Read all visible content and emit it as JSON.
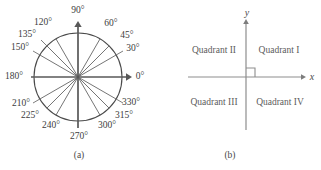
{
  "figure": {
    "panels": [
      {
        "id": "a",
        "caption": "(a)",
        "type": "polar-angle-diagram",
        "description": "Unit circle with rays drawn at standard angles, labeled in degrees",
        "circle": {
          "center_x": 78,
          "center_y": 77,
          "radius": 44
        },
        "axes": {
          "horizontal": {
            "x1": 31,
            "x2": 128,
            "y": 77,
            "arrow": "right"
          },
          "vertical": {
            "y1": 25,
            "y2": 128,
            "x": 78,
            "arrow": "up"
          }
        },
        "angle_labels": [
          {
            "text": "90°",
            "deg": 90,
            "x": 78,
            "y": 11,
            "align": "center"
          },
          {
            "text": "120°",
            "deg": 120,
            "x": 43,
            "y": 23,
            "align": "center"
          },
          {
            "text": "135°",
            "deg": 135,
            "x": 27,
            "y": 35,
            "align": "center"
          },
          {
            "text": "150°",
            "deg": 150,
            "x": 20,
            "y": 48,
            "align": "center"
          },
          {
            "text": "180°",
            "deg": 180,
            "x": 14,
            "y": 77,
            "align": "center"
          },
          {
            "text": "210°",
            "deg": 210,
            "x": 21,
            "y": 104,
            "align": "center"
          },
          {
            "text": "225°",
            "deg": 225,
            "x": 30,
            "y": 116,
            "align": "center"
          },
          {
            "text": "240°",
            "deg": 240,
            "x": 51,
            "y": 126,
            "align": "center"
          },
          {
            "text": "270°",
            "deg": 270,
            "x": 79,
            "y": 137,
            "align": "center"
          },
          {
            "text": "300°",
            "deg": 300,
            "x": 107,
            "y": 126,
            "align": "center"
          },
          {
            "text": "315°",
            "deg": 315,
            "x": 124,
            "y": 116,
            "align": "center"
          },
          {
            "text": "330°",
            "deg": 330,
            "x": 131,
            "y": 103,
            "align": "center"
          },
          {
            "text": "0°",
            "deg": 0,
            "x": 140,
            "y": 77,
            "align": "center"
          },
          {
            "text": "30°",
            "deg": 30,
            "x": 133,
            "y": 49,
            "align": "center"
          },
          {
            "text": "45°",
            "deg": 45,
            "x": 127,
            "y": 36,
            "align": "center"
          },
          {
            "text": "60°",
            "deg": 60,
            "x": 111,
            "y": 24,
            "align": "center"
          }
        ],
        "ray_angles_deg": [
          30,
          45,
          60,
          120,
          135,
          150,
          210,
          225,
          240,
          300,
          315,
          330
        ],
        "leader_lines": [
          {
            "deg": 150,
            "from_r": 44,
            "to_r": 52
          },
          {
            "deg": 135,
            "from_r": 44,
            "to_r": 52
          },
          {
            "deg": 30,
            "from_r": 44,
            "to_r": 52
          },
          {
            "deg": 210,
            "from_r": 44,
            "to_r": 52
          },
          {
            "deg": 330,
            "from_r": 44,
            "to_r": 52
          }
        ]
      },
      {
        "id": "b",
        "caption": "(b)",
        "type": "quadrant-diagram",
        "description": "Cartesian axes dividing the plane into four labeled quadrants",
        "origin": {
          "x": 86,
          "y": 77
        },
        "axes": {
          "horizontal": {
            "x1": 28,
            "x2": 143,
            "y": 77,
            "arrow": "right",
            "label": "x"
          },
          "vertical": {
            "y1": 22,
            "y2": 130,
            "x": 86,
            "arrow": "up",
            "label": "y"
          }
        },
        "axis_labels": [
          {
            "name": "y-axis-label",
            "text": "y",
            "x": 87,
            "y": 13
          },
          {
            "name": "x-axis-label",
            "text": "x",
            "x": 152,
            "y": 77
          }
        ],
        "right_angle_marker": {
          "x": 86,
          "y": 77,
          "size": 9
        },
        "quadrant_labels": [
          {
            "name": "quadrant-2",
            "text": "Quadrant II",
            "x": 54,
            "y": 51
          },
          {
            "name": "quadrant-1",
            "text": "Quadrant I",
            "x": 119,
            "y": 51
          },
          {
            "name": "quadrant-3",
            "text": "Quadrant III",
            "x": 54,
            "y": 103
          },
          {
            "name": "quadrant-4",
            "text": "Quadrant IV",
            "x": 120,
            "y": 103
          }
        ]
      }
    ],
    "colors": {
      "background": "#ffffff",
      "axis": "#585858",
      "circle": "#4a4a4a",
      "ray": "#6e6e6e",
      "text": "#3d3d3d",
      "quadrant_text": "#5c5c5c"
    }
  }
}
